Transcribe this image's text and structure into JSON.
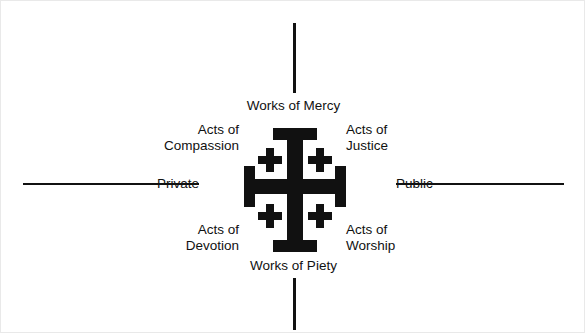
{
  "diagram": {
    "colors": {
      "ink": "#111111",
      "background": "#ffffff"
    },
    "axes": {
      "vertical": {
        "top_label": "Works of Mercy",
        "bottom_label": "Works of Piety"
      },
      "horizontal": {
        "left_label": "Private",
        "right_label": "Public"
      }
    },
    "quadrants": [
      {
        "name": "top-left",
        "line1": "Acts of",
        "line2": "Compassion"
      },
      {
        "name": "top-right",
        "line1": "Acts of",
        "line2": "Justice"
      },
      {
        "name": "bottom-left",
        "line1": "Acts of",
        "line2": "Devotion"
      },
      {
        "name": "bottom-right",
        "line1": "Acts of",
        "line2": "Worship"
      }
    ],
    "center_emblem": {
      "icon": "jerusalem-cross-icon",
      "description": "Jerusalem Cross"
    }
  }
}
